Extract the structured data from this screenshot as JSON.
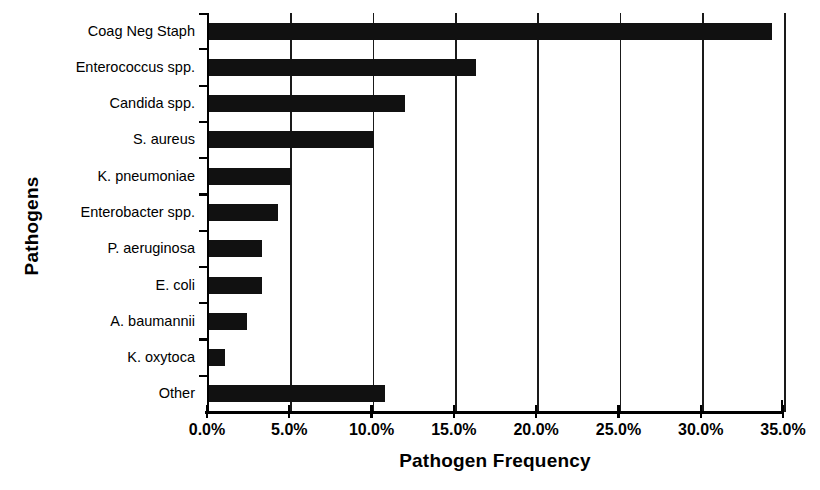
{
  "chart_data": {
    "type": "bar",
    "orientation": "horizontal",
    "title": "",
    "xlabel": "Pathogen Frequency",
    "ylabel": "Pathogens",
    "categories": [
      "Coag Neg Staph",
      "Enterococcus spp.",
      "Candida spp.",
      "S. aureus",
      "K. pneumoniae",
      "Enterobacter spp.",
      "P. aeruginosa",
      "E. coli",
      "A. baumannii",
      "K. oxytoca",
      "Other"
    ],
    "values": [
      34.2,
      16.2,
      11.9,
      10.0,
      5.0,
      4.2,
      3.2,
      3.2,
      2.3,
      1.0,
      10.7
    ],
    "value_unit": "%",
    "xlim": [
      0.0,
      35.0
    ],
    "xticks": [
      0.0,
      5.0,
      10.0,
      15.0,
      20.0,
      25.0,
      30.0,
      35.0
    ],
    "xticklabels": [
      "0.0%",
      "5.0%",
      "10.0%",
      "15.0%",
      "20.0%",
      "25.0%",
      "30.0%",
      "35.0%"
    ],
    "grid": "vertical",
    "legend": "none",
    "bar_color": "#111111"
  }
}
